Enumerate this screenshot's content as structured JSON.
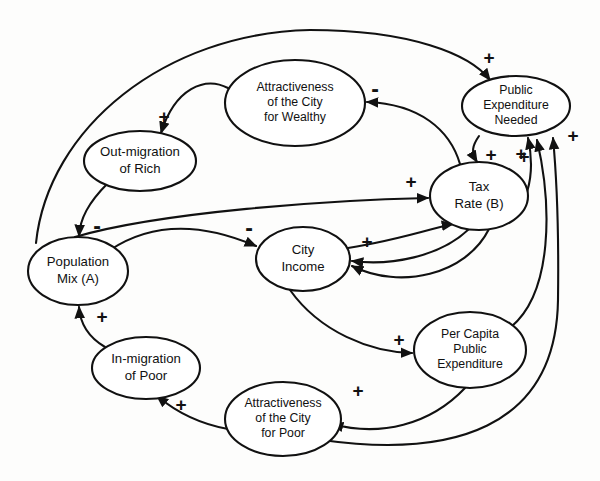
{
  "diagram": {
    "type": "causal-loop-diagram",
    "stroke_color": "#111111",
    "node_fill": "#ffffff",
    "background": "#fdfdfc",
    "nodes": [
      {
        "id": "out_migration_rich",
        "label": "Out-migration\nof Rich",
        "lines": [
          "Out-migration",
          "of Rich"
        ],
        "cx": 140,
        "cy": 161,
        "rx": 56,
        "ry": 30
      },
      {
        "id": "attractiveness_wealthy",
        "label": "Attractiveness\nof the City\nfor Wealthy",
        "lines": [
          "Attractiveness",
          "of the City",
          "for Wealthy"
        ],
        "cx": 295,
        "cy": 103,
        "rx": 70,
        "ry": 43
      },
      {
        "id": "public_expenditure_needed",
        "label": "Public\nExpenditure\nNeeded",
        "lines": [
          "Public",
          "Expenditure",
          "Needed"
        ],
        "cx": 516,
        "cy": 106,
        "rx": 54,
        "ry": 30
      },
      {
        "id": "tax_rate",
        "label": "Tax\nRate (B)",
        "lines": [
          "Tax",
          "Rate (B)"
        ],
        "cx": 479,
        "cy": 196,
        "rx": 49,
        "ry": 34
      },
      {
        "id": "population_mix",
        "label": "Population\nMix (A)",
        "lines": [
          "Population",
          "Mix (A)"
        ],
        "cx": 78,
        "cy": 271,
        "rx": 50,
        "ry": 34
      },
      {
        "id": "city_income",
        "label": "City\nIncome",
        "lines": [
          "City",
          "Income"
        ],
        "cx": 303,
        "cy": 259,
        "rx": 47,
        "ry": 32
      },
      {
        "id": "per_capita_public_expenditure",
        "label": "Per Capita\nPublic\nExpenditure",
        "lines": [
          "Per Capita",
          "Public",
          "Expenditure"
        ],
        "cx": 470,
        "cy": 350,
        "rx": 56,
        "ry": 38
      },
      {
        "id": "in_migration_poor",
        "label": "In-migration\nof Poor",
        "lines": [
          "In-migration",
          "of Poor"
        ],
        "cx": 146,
        "cy": 368,
        "rx": 54,
        "ry": 31
      },
      {
        "id": "attractiveness_poor",
        "label": "Attractiveness\nof the City\nfor Poor",
        "lines": [
          "Attractiveness",
          "of the City",
          "for Poor"
        ],
        "cx": 283,
        "cy": 419,
        "rx": 58,
        "ry": 37
      }
    ],
    "links": [
      {
        "id": "attr_wealthy_to_out_migration",
        "from": "attractiveness_wealthy",
        "to": "out_migration_rich",
        "polarity": "+",
        "polarity_x": 164,
        "polarity_y": 118,
        "path": "M 228 88 C 205 76, 175 88, 161 133"
      },
      {
        "id": "out_migration_to_population_mix",
        "from": "out_migration_rich",
        "to": "population_mix",
        "polarity": "-",
        "polarity_x": 97,
        "polarity_y": 228,
        "path": "M 108 183 C 88 203, 80 219, 79 236"
      },
      {
        "id": "population_mix_to_public_expenditure",
        "from": "population_mix",
        "to": "public_expenditure_needed",
        "polarity": "+",
        "polarity_x": 489,
        "polarity_y": 59,
        "path": "M 36 243 C 48 128, 165 33, 310 30 C 410 30, 470 54, 490 80"
      },
      {
        "id": "population_mix_to_city_income",
        "from": "population_mix",
        "to": "city_income",
        "polarity": "-",
        "polarity_x": 249,
        "polarity_y": 230,
        "path": "M 110 250 C 152 222, 200 222, 256 246"
      },
      {
        "id": "population_mix_to_tax_rate",
        "from": "population_mix",
        "to": "tax_rate",
        "polarity": "+",
        "polarity_x": 411,
        "polarity_y": 183,
        "path": "M 75 237 C 160 212, 330 200, 428 198"
      },
      {
        "id": "city_income_to_tax_rate_neg",
        "from": "city_income",
        "to": "tax_rate",
        "polarity": "",
        "polarity_x": 0,
        "polarity_y": 0,
        "path": "M 348 248 C 400 240, 440 226, 453 224"
      },
      {
        "id": "public_expenditure_to_tax_rate",
        "from": "public_expenditure_needed",
        "to": "tax_rate",
        "polarity": "+",
        "polarity_x": 491,
        "polarity_y": 156,
        "path": "M 479 136 C 472 146, 471 152, 477 162"
      },
      {
        "id": "tax_rate_to_attr_wealthy",
        "from": "tax_rate",
        "to": "attractiveness_wealthy",
        "polarity": "-",
        "polarity_x": 375,
        "polarity_y": 91,
        "path": "M 460 164 C 450 130, 420 104, 367 102"
      },
      {
        "id": "tax_rate_to_city_income_a",
        "from": "tax_rate",
        "to": "city_income",
        "polarity": "+",
        "polarity_x": 367,
        "polarity_y": 243,
        "path": "M 469 229 C 440 257, 390 266, 352 261"
      },
      {
        "id": "tax_rate_to_city_income_b",
        "from": "tax_rate",
        "to": "city_income",
        "polarity": "",
        "polarity_x": 0,
        "polarity_y": 0,
        "path": "M 489 229 C 466 275, 400 290, 352 266"
      },
      {
        "id": "tax_rate_to_public_expenditure",
        "from": "tax_rate",
        "to": "public_expenditure_needed",
        "polarity": "+",
        "polarity_x": 521,
        "polarity_y": 155,
        "path": "M 499 226 C 528 212, 536 175, 528 138"
      },
      {
        "id": "city_income_to_per_capita",
        "from": "city_income",
        "to": "per_capita_public_expenditure",
        "polarity": "+",
        "polarity_x": 399,
        "polarity_y": 341,
        "path": "M 290 290 C 320 332, 370 352, 412 353"
      },
      {
        "id": "per_capita_to_public_expenditure",
        "from": "per_capita_public_expenditure",
        "to": "public_expenditure_needed",
        "polarity": "+",
        "polarity_x": 524,
        "polarity_y": 158,
        "path": "M 511 327 C 553 292, 552 205, 537 140"
      },
      {
        "id": "per_capita_to_attr_poor",
        "from": "per_capita_public_expenditure",
        "to": "attractiveness_poor",
        "polarity": "+",
        "polarity_x": 358,
        "polarity_y": 392,
        "path": "M 465 388 C 430 425, 380 437, 332 424"
      },
      {
        "id": "attr_poor_to_in_migration",
        "from": "attractiveness_poor",
        "to": "in_migration_poor",
        "polarity": "+",
        "polarity_x": 181,
        "polarity_y": 406,
        "path": "M 228 429 C 200 424, 175 411, 157 396"
      },
      {
        "id": "in_migration_to_population_mix",
        "from": "in_migration_poor",
        "to": "population_mix",
        "polarity": "+",
        "polarity_x": 102,
        "polarity_y": 318,
        "path": "M 105 347 C 88 337, 80 322, 79 307"
      },
      {
        "id": "attr_poor_to_public_expenditure",
        "from": "attractiveness_poor",
        "to": "public_expenditure_needed",
        "polarity": "+",
        "polarity_x": 573,
        "polarity_y": 137,
        "path": "M 322 440 C 450 458, 556 430, 558 300 C 559 225, 556 170, 553 138"
      }
    ],
    "polarity_symbols": {
      "positive": "+",
      "negative": "-"
    }
  }
}
